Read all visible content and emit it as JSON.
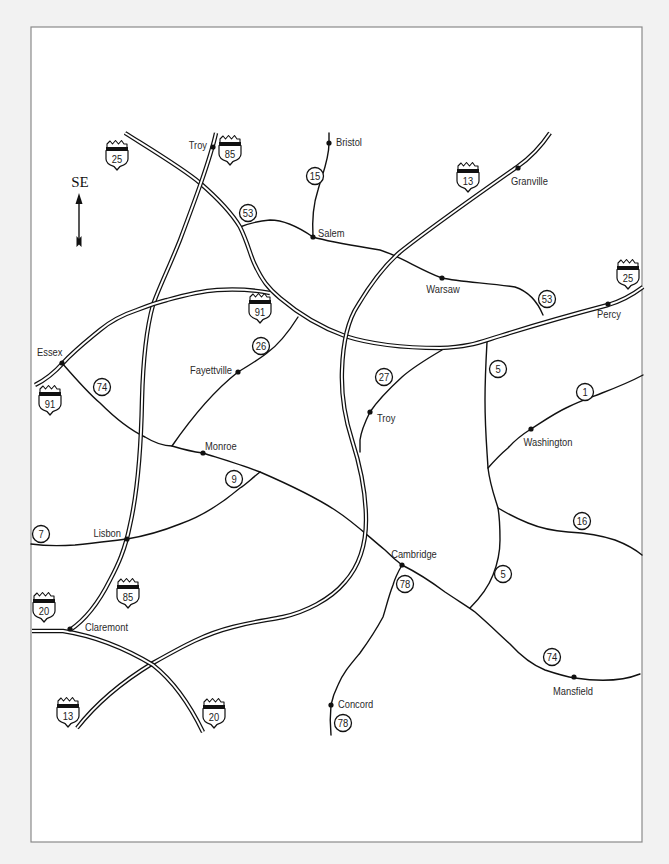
{
  "compass": {
    "label": "SE",
    "icon": "direction-arrow-icon"
  },
  "interstates": [
    {
      "number": "25",
      "path": "M125,133 C160,155 185,170 200,183 C215,196 230,210 240,227 C248,243 250,255 255,265 C262,280 268,288 280,298 C300,315 320,327 345,336 C370,344 400,348 440,348 C470,347 480,342 500,336 C535,325 570,315 608,305 C625,300 635,293 643,287",
      "shields": [
        "translate(117,155)",
        "translate(628,274)"
      ]
    },
    {
      "number": "85",
      "path": "M216,133 C210,160 195,200 180,240 C168,270 158,290 153,305 C146,330 143,360 142,400 C141,450 138,490 130,525 C125,550 118,565 110,580 C100,600 88,618 70,630",
      "shields": [
        "translate(230,150)",
        "translate(128,593)"
      ]
    },
    {
      "number": "13",
      "path": "M77,728 C95,705 120,683 153,663 C185,645 205,634 233,627 C255,621 270,620 283,617 C305,612 330,600 345,582 C360,565 366,545 366,520 C366,490 360,465 352,440 C344,415 341,395 342,370 C343,340 348,320 358,305 C370,285 385,265 400,252 C430,228 470,200 517,167 C530,158 542,145 550,133",
      "shields": [
        "translate(468,177)",
        "translate(68,712)"
      ]
    },
    {
      "number": "91",
      "path": "M35,385 C45,380 55,372 63,363 C75,350 88,340 100,330 C112,320 125,314 137,310 C150,305 158,302 167,300 C185,295 200,291 217,290 C235,289 255,290 270,293",
      "shields": [
        "translate(260,308)",
        "translate(50,400)"
      ]
    },
    {
      "number": "20",
      "path": "M32,631 L63,631 C95,636 128,650 153,665 C172,680 190,705 203,732",
      "shields": [
        "translate(44,607)",
        "translate(214,713)"
      ]
    }
  ],
  "routes": [
    {
      "number": "53",
      "path": "M240,227 C250,223 258,221 270,220 C285,220 300,228 313,237 C330,242 350,245 380,250 C400,256 420,270 442,278 C460,282 490,283 515,287 C530,292 538,303 543,315",
      "markers": [
        "translate(248,213)",
        "translate(547,299)"
      ]
    },
    {
      "number": "15",
      "path": "M329,133 L329,143 C329,160 322,175 318,190 C313,205 312,220 313,237",
      "markers": [
        "translate(315,176)"
      ]
    },
    {
      "number": "74",
      "path": "M62,363 C75,378 88,393 100,403 C115,418 130,430 145,437 C158,445 165,446 172,446 C185,450 195,452 203,453 C225,460 245,466 260,472 C290,485 315,497 335,510 C355,523 370,538 385,550 C393,558 398,562 402,565 C418,573 433,583 445,592 C460,602 470,608 475,612 C490,625 500,635 510,644 C520,655 530,664 545,670 C560,675 568,677 575,678 C595,681 620,682 640,674",
      "markers": [
        "translate(102,387)",
        "translate(552,657)"
      ]
    },
    {
      "number": "26",
      "path": "M298,317 C288,333 278,345 267,353 C258,360 248,366 238,372 C215,390 190,420 172,446",
      "markers": [
        "translate(261,346)"
      ]
    },
    {
      "number": "9",
      "path": "M260,472 C250,480 245,485 240,488 C220,505 200,517 180,524 C160,532 145,536 127,539",
      "markers": [
        "translate(234,479)"
      ]
    },
    {
      "number": "7",
      "path": "M31,544 C45,546 60,546 75,545 C95,543 110,541 127,539",
      "markers": [
        "translate(41,534)"
      ]
    },
    {
      "number": "27",
      "path": "M442,350 C425,360 412,368 402,377 C390,388 378,400 370,412 C365,422 361,432 360,440 L360,452",
      "markers": [
        "translate(384,377)"
      ]
    },
    {
      "number": "5",
      "path": "M487,342 C486,360 485,380 485,400 C485,430 487,450 488,468 C490,485 495,498 498,508 C500,520 500,530 500,540 C500,555 497,565 493,575 C488,588 478,600 470,608",
      "markers": [
        "translate(498,369)",
        "translate(503,574)"
      ]
    },
    {
      "number": "1",
      "path": "M488,468 C495,460 502,453 508,448 C515,440 523,434 531,429 C545,420 555,413 568,407 C580,401 592,397 602,393 C615,388 630,382 643,375",
      "markers": [
        "translate(585,392)"
      ]
    },
    {
      "number": "16",
      "path": "M498,508 C508,514 518,519 528,523 C540,528 555,531 568,532 C585,533 600,535 615,540 C628,545 636,550 642,555",
      "markers": [
        "translate(582,521)"
      ]
    },
    {
      "number": "78",
      "path": "M402,565 C398,572 395,578 393,585 C388,598 386,608 383,617 C376,630 368,642 360,653 C350,665 343,673 338,685 C334,693 332,700 331,705 C330,715 330,725 331,735",
      "markers": [
        "translate(405,584)",
        "translate(343,723)"
      ]
    }
  ],
  "cities": [
    {
      "name": "Troy",
      "dot": "translate(213,147)",
      "label_pos": "translate(207,149)"
    },
    {
      "name": "Bristol",
      "dot": "translate(329,143)",
      "label_pos": "translate(336,146)"
    },
    {
      "name": "Salem",
      "dot": "translate(313,237)",
      "label_pos": "translate(318,237)"
    },
    {
      "name": "Granville",
      "dot": "translate(518,168)",
      "label_pos": "translate(511,185)"
    },
    {
      "name": "Warsaw",
      "dot": "translate(442,278)",
      "label_pos": "translate(443,293)"
    },
    {
      "name": "Percy",
      "dot": "translate(608,304)",
      "label_pos": "translate(609,318)"
    },
    {
      "name": "Essex",
      "dot": "translate(62,363)",
      "label_pos": "translate(37,356)"
    },
    {
      "name": "Fayettville",
      "dot": "translate(238,372)",
      "label_pos": "translate(232,374)"
    },
    {
      "name": "Monroe",
      "dot": "translate(203,453)",
      "label_pos": "translate(205,450)"
    },
    {
      "name": "Lisbon",
      "dot": "translate(127,539)",
      "label_pos": "translate(121,537)"
    },
    {
      "name": "Troy",
      "dot": "translate(370,412)",
      "label_pos": "translate(377,422)"
    },
    {
      "name": "Washington",
      "dot": "translate(531,429)",
      "label_pos": "translate(548,446)"
    },
    {
      "name": "Cambridge",
      "dot": "translate(402,565)",
      "label_pos": "translate(414,558)"
    },
    {
      "name": "Claremont",
      "dot": "translate(70,629)",
      "label_pos": "translate(85,631)"
    },
    {
      "name": "Concord",
      "dot": "translate(331,705)",
      "label_pos": "translate(338,708)"
    },
    {
      "name": "Mansfield",
      "dot": "translate(574,677)",
      "label_pos": "translate(573,695)"
    }
  ]
}
